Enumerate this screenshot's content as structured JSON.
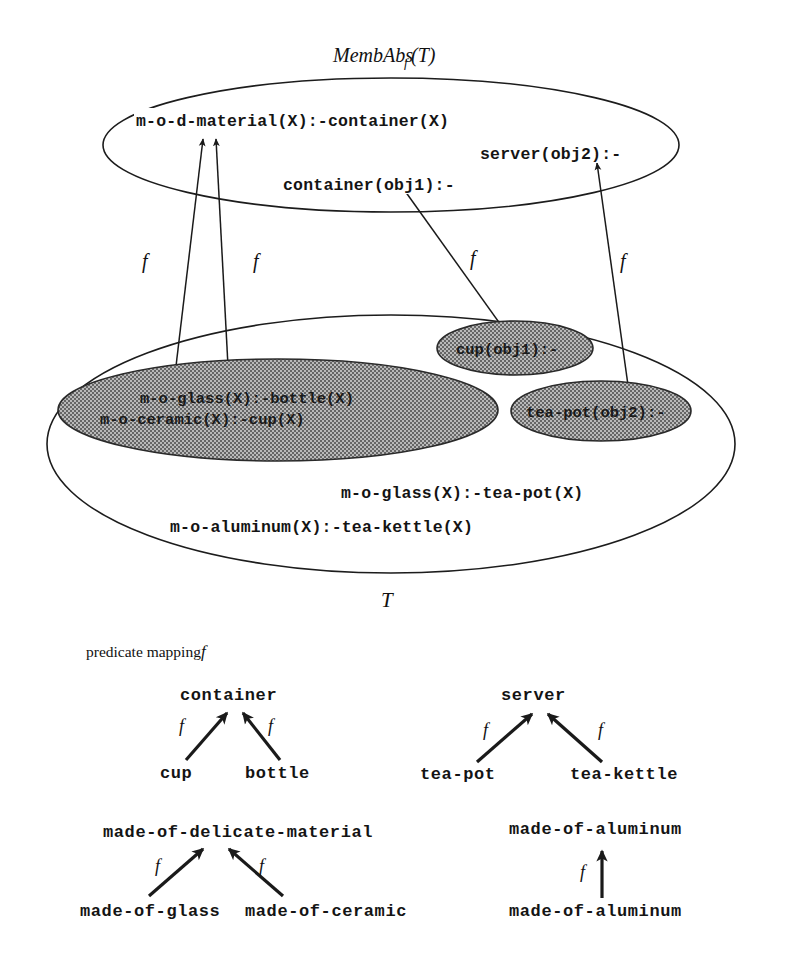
{
  "figure": {
    "top_set_label": "MembAbs",
    "top_set_label_sub": "f",
    "top_set_label_arg": "(T)",
    "bottom_set_label": "T",
    "mapping_caption": "predicate mapping",
    "mapping_caption_symbol": "f",
    "arrow_label": "f"
  },
  "abstract_theory": {
    "clauses": [
      {
        "id": "mod-material",
        "text": "m-o-d-material(X):-container(X)"
      },
      {
        "id": "server-obj2",
        "text": "server(obj2):-"
      },
      {
        "id": "container-obj1",
        "text": "container(obj1):-"
      }
    ]
  },
  "base_theory": {
    "shaded_blobs": [
      {
        "id": "blob-glass-ceramic",
        "lines": [
          "m-o-glass(X):-bottle(X)",
          "m-o-ceramic(X):-cup(X)"
        ]
      },
      {
        "id": "blob-cup-obj1",
        "lines": [
          "cup(obj1):-"
        ]
      },
      {
        "id": "blob-teapot-obj2",
        "lines": [
          "tea-pot(obj2):-"
        ]
      }
    ],
    "plain_clauses": [
      {
        "id": "glass-teapot",
        "text": "m-o-glass(X):-tea-pot(X)"
      },
      {
        "id": "aluminum-teakettle",
        "text": "m-o-aluminum(X):-tea-kettle(X)"
      }
    ]
  },
  "mapping_groups": [
    {
      "id": "container-group",
      "parent": "container",
      "children": [
        "cup",
        "bottle"
      ],
      "edge_labels": [
        "f",
        "f"
      ]
    },
    {
      "id": "server-group",
      "parent": "server",
      "children": [
        "tea-pot",
        "tea-kettle"
      ],
      "edge_labels": [
        "f",
        "f"
      ]
    },
    {
      "id": "delicate-material-group",
      "parent": "made-of-delicate-material",
      "children": [
        "made-of-glass",
        "made-of-ceramic"
      ],
      "edge_labels": [
        "f",
        "f"
      ]
    },
    {
      "id": "aluminum-group",
      "parent": "made-of-aluminum",
      "children": [
        "made-of-aluminum"
      ],
      "edge_labels": [
        "f"
      ]
    }
  ],
  "colors": {
    "ink": "#141414",
    "shade": "#8a8a8a",
    "paper": "#ffffff"
  }
}
